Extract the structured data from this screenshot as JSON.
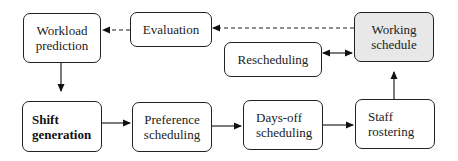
{
  "diagram": {
    "nodes": {
      "workload_prediction": {
        "line1": "Workload",
        "line2": "prediction"
      },
      "evaluation": {
        "label": "Evaluation"
      },
      "working_schedule": {
        "line1": "Working",
        "line2": "schedule",
        "fill": "#e8e8e8"
      },
      "rescheduling": {
        "label": "Rescheduling"
      },
      "shift_generation": {
        "line1": "Shift",
        "line2": "generation"
      },
      "preference_scheduling": {
        "line1": "Preference",
        "line2": "scheduling"
      },
      "days_off_scheduling": {
        "line1": "Days-off",
        "line2": "scheduling"
      },
      "staff_rostering": {
        "line1": "Staff",
        "line2": "rostering"
      }
    },
    "edges": [
      {
        "from": "working_schedule",
        "to": "evaluation",
        "style": "dashed"
      },
      {
        "from": "evaluation",
        "to": "workload_prediction",
        "style": "dashed"
      },
      {
        "from": "workload_prediction",
        "to": "shift_generation",
        "style": "solid"
      },
      {
        "from": "shift_generation",
        "to": "preference_scheduling",
        "style": "solid"
      },
      {
        "from": "preference_scheduling",
        "to": "days_off_scheduling",
        "style": "solid"
      },
      {
        "from": "days_off_scheduling",
        "to": "staff_rostering",
        "style": "solid"
      },
      {
        "from": "staff_rostering",
        "to": "working_schedule",
        "style": "solid"
      },
      {
        "from": "rescheduling",
        "to": "working_schedule",
        "style": "solid",
        "bidirectional": true
      }
    ],
    "colors": {
      "stroke": "#222222",
      "shaded_fill": "#e8e8e8"
    }
  }
}
